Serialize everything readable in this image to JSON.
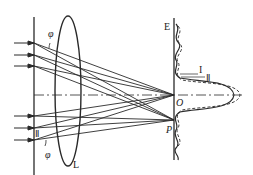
{
  "diagram": {
    "type": "optics-lens-focusing-diffraction",
    "labels": {
      "phi_top": "φ",
      "phi_bottom": "φ",
      "lens": "L",
      "screen": "E",
      "origin": "O",
      "point_p": "P",
      "curve_1": "I",
      "curve_2": "Ⅱ",
      "beam_2_marker": "Ⅱ"
    },
    "colors": {
      "stroke": "#2a2a2a",
      "background": "#ffffff"
    }
  }
}
